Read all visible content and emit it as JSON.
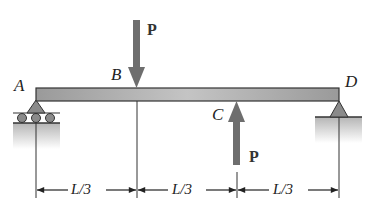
{
  "diagram": {
    "type": "simply supported beam with two point loads",
    "points": {
      "A": "A",
      "B": "B",
      "C": "C",
      "D": "D"
    },
    "loads": [
      {
        "label": "P",
        "at": "B",
        "direction": "down"
      },
      {
        "label": "P",
        "at": "C",
        "direction": "up"
      }
    ],
    "supports": [
      {
        "at": "A",
        "type": "roller"
      },
      {
        "at": "D",
        "type": "pin"
      }
    ],
    "dimensions": [
      "L/3",
      "L/3",
      "L/3"
    ],
    "colors": {
      "beam": "#a8a8a8",
      "arrow": "#6e6e6e",
      "ground": "#c8c8c8",
      "line": "#222222"
    }
  }
}
